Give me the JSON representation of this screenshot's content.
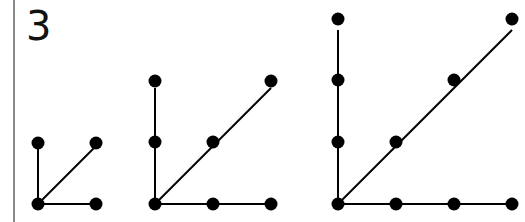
{
  "label": "3",
  "colors": {
    "ink": "#000000",
    "border": "#8a8a8a",
    "background": "#ffffff"
  },
  "figures": [
    {
      "name": "figure-1",
      "points_per_arm": 2,
      "origin": [
        38,
        204
      ],
      "step": 58,
      "dots": [
        [
          38,
          204
        ],
        [
          38,
          143
        ],
        [
          96,
          143
        ],
        [
          96,
          204
        ]
      ],
      "arms": [
        "vertical",
        "diagonal",
        "horizontal"
      ]
    },
    {
      "name": "figure-2",
      "points_per_arm": 3,
      "origin": [
        155,
        204
      ],
      "step": 58,
      "dots": [
        [
          155,
          204
        ],
        [
          155,
          142
        ],
        [
          155,
          81
        ],
        [
          213,
          142
        ],
        [
          271,
          81
        ],
        [
          213,
          204
        ],
        [
          271,
          204
        ]
      ],
      "arms": [
        "vertical",
        "diagonal",
        "horizontal"
      ]
    },
    {
      "name": "figure-3",
      "points_per_arm": 4,
      "origin": [
        338,
        204
      ],
      "step": 58,
      "dots": [
        [
          338,
          204
        ],
        [
          338,
          142
        ],
        [
          338,
          80
        ],
        [
          338,
          19
        ],
        [
          396,
          142
        ],
        [
          454,
          80
        ],
        [
          512,
          19
        ],
        [
          396,
          204
        ],
        [
          454,
          204
        ],
        [
          512,
          204
        ]
      ],
      "arms": [
        "vertical",
        "diagonal",
        "horizontal"
      ]
    }
  ]
}
